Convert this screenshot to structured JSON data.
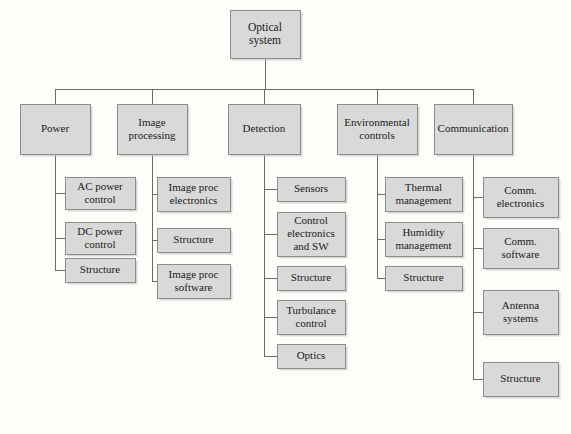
{
  "diagram": {
    "type": "tree-hierarchy",
    "background_color": "#fdfdfa",
    "box_fill_color": "#d9d9d9",
    "box_border_color": "#8c8c8c",
    "connector_color": "#6b6b6b",
    "text_color": "#1a1a1a",
    "root": {
      "id": "optical-system",
      "label": "Optical system",
      "lines": [
        "Optical",
        "system"
      ],
      "x": 230,
      "y": 10,
      "w": 70,
      "h": 48
    },
    "level2": [
      {
        "id": "power",
        "label": "Power",
        "lines": [
          "Power"
        ],
        "x": 20,
        "y": 104,
        "w": 70,
        "h": 50
      },
      {
        "id": "image-processing",
        "label": "Image processing",
        "lines": [
          "Image",
          "processing"
        ],
        "x": 117,
        "y": 104,
        "w": 70,
        "h": 50
      },
      {
        "id": "detection",
        "label": "Detection",
        "lines": [
          "Detection"
        ],
        "x": 228,
        "y": 104,
        "w": 72,
        "h": 50
      },
      {
        "id": "environmental-controls",
        "label": "Environmental controls",
        "lines": [
          "Environmental",
          "controls"
        ],
        "x": 337,
        "y": 104,
        "w": 80,
        "h": 50
      },
      {
        "id": "communication",
        "label": "Communication",
        "lines": [
          "Communication"
        ],
        "x": 434,
        "y": 104,
        "w": 78,
        "h": 50
      }
    ],
    "level3": [
      {
        "parent": "power",
        "children": [
          {
            "id": "ac-power-control",
            "label": "AC power control",
            "lines": [
              "AC power",
              "control"
            ],
            "x": 65,
            "y": 177,
            "w": 70,
            "h": 32
          },
          {
            "id": "dc-power-control",
            "label": "DC power control",
            "lines": [
              "DC power",
              "control"
            ],
            "x": 65,
            "y": 222,
            "w": 70,
            "h": 32
          },
          {
            "id": "power-structure",
            "label": "Structure",
            "lines": [
              "Structure"
            ],
            "x": 65,
            "y": 258,
            "w": 70,
            "h": 24
          }
        ]
      },
      {
        "parent": "image-processing",
        "children": [
          {
            "id": "image-proc-electronics",
            "label": "Image proc electronics",
            "lines": [
              "Image proc",
              "electronics"
            ],
            "x": 157,
            "y": 177,
            "w": 73,
            "h": 34
          },
          {
            "id": "image-proc-structure",
            "label": "Structure",
            "lines": [
              "Structure"
            ],
            "x": 157,
            "y": 228,
            "w": 73,
            "h": 24
          },
          {
            "id": "image-proc-software",
            "label": "Image proc software",
            "lines": [
              "Image proc",
              "software"
            ],
            "x": 157,
            "y": 264,
            "w": 73,
            "h": 34
          }
        ]
      },
      {
        "parent": "detection",
        "children": [
          {
            "id": "sensors",
            "label": "Sensors",
            "lines": [
              "Sensors"
            ],
            "x": 277,
            "y": 177,
            "w": 68,
            "h": 24
          },
          {
            "id": "control-electronics-and-sw",
            "label": "Control electronics and SW",
            "lines": [
              "Control",
              "electronics",
              "and SW"
            ],
            "x": 277,
            "y": 212,
            "w": 68,
            "h": 44
          },
          {
            "id": "detection-structure",
            "label": "Structure",
            "lines": [
              "Structure"
            ],
            "x": 277,
            "y": 266,
            "w": 68,
            "h": 24
          },
          {
            "id": "turbulance-control",
            "label": "Turbulance control",
            "lines": [
              "Turbulance",
              "control"
            ],
            "x": 277,
            "y": 300,
            "w": 68,
            "h": 34
          },
          {
            "id": "optics",
            "label": "Optics",
            "lines": [
              "Optics"
            ],
            "x": 277,
            "y": 344,
            "w": 68,
            "h": 24
          }
        ]
      },
      {
        "parent": "environmental-controls",
        "children": [
          {
            "id": "thermal-management",
            "label": "Thermal management",
            "lines": [
              "Thermal",
              "management"
            ],
            "x": 385,
            "y": 177,
            "w": 77,
            "h": 34
          },
          {
            "id": "humidity-management",
            "label": "Humidity management",
            "lines": [
              "Humidity",
              "management"
            ],
            "x": 385,
            "y": 222,
            "w": 77,
            "h": 34
          },
          {
            "id": "environmental-structure",
            "label": "Structure",
            "lines": [
              "Structure"
            ],
            "x": 385,
            "y": 266,
            "w": 77,
            "h": 24
          }
        ]
      },
      {
        "parent": "communication",
        "children": [
          {
            "id": "comm-electronics",
            "label": "Comm. electronics",
            "lines": [
              "Comm.",
              "electronics"
            ],
            "x": 483,
            "y": 177,
            "w": 75,
            "h": 40
          },
          {
            "id": "comm-software",
            "label": "Comm. software",
            "lines": [
              "Comm.",
              "software"
            ],
            "x": 483,
            "y": 228,
            "w": 75,
            "h": 40
          },
          {
            "id": "antenna-systems",
            "label": "Antenna systems",
            "lines": [
              "Antenna",
              "systems"
            ],
            "x": 483,
            "y": 290,
            "w": 75,
            "h": 44
          },
          {
            "id": "communication-structure",
            "label": "Structure",
            "lines": [
              "Structure"
            ],
            "x": 483,
            "y": 362,
            "w": 75,
            "h": 34
          }
        ]
      }
    ]
  }
}
